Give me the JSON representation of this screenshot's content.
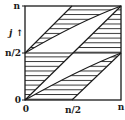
{
  "figure": {
    "y_axis": {
      "label": "j",
      "arrow": "↑",
      "ticks": [
        "n",
        "n/2",
        "0"
      ]
    },
    "x_axis": {
      "ticks": [
        "0",
        "n/2",
        "n"
      ]
    },
    "colors": {
      "ink": "#1a1a1a",
      "background": "#ffffff"
    },
    "regions": [
      {
        "name": "upper-left-lens",
        "hatched": true
      },
      {
        "name": "upper-right-triangle",
        "hatched": true
      },
      {
        "name": "lower-left-triangle",
        "hatched": true
      },
      {
        "name": "lower-right-lens",
        "hatched": true
      }
    ]
  }
}
